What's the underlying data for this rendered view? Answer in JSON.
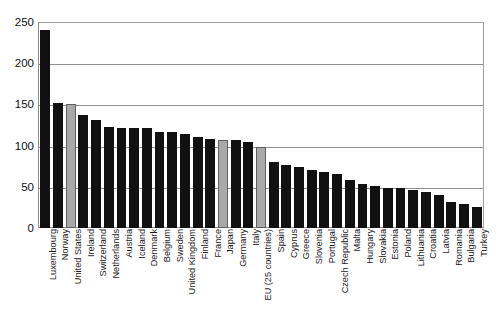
{
  "chart_data": {
    "type": "bar",
    "title": "",
    "subtitle": "",
    "xlabel": "",
    "ylabel": "",
    "ylim": [
      0,
      250
    ],
    "yticks": [
      0,
      50,
      100,
      150,
      200,
      250
    ],
    "grid": true,
    "legend": "none",
    "orientation": "vertical",
    "categories": [
      "Luxembourg",
      "Norway",
      "United States",
      "Ireland",
      "Switzerland",
      "Netherlands",
      "Austria",
      "Iceland",
      "Denmark",
      "Belgium",
      "Sweden",
      "United Kingdom",
      "Finland",
      "France",
      "Japan",
      "Germany",
      "Italy",
      "EU (25 countries)",
      "Spain",
      "Cyprus",
      "Greece",
      "Slovenia",
      "Portugal",
      "Czech Republic",
      "Malta",
      "Hungary",
      "Slovakia",
      "Estonia",
      "Poland",
      "Lithuania",
      "Croatia",
      "Latvia",
      "Romania",
      "Bulgaria",
      "Turkey"
    ],
    "values": [
      240,
      152,
      150,
      137,
      131,
      123,
      121,
      121,
      121,
      117,
      116,
      114,
      110,
      108,
      107,
      107,
      104,
      98,
      80,
      77,
      74,
      71,
      68,
      66,
      58,
      54,
      51,
      49,
      49,
      46,
      44,
      40,
      31,
      29,
      26
    ],
    "highlighted": [
      "United States",
      "Japan",
      "EU (25 countries)"
    ],
    "colors": {
      "bar": "#111111",
      "bar_highlight": "#a9a9a9",
      "bar_highlight_border": "#5f5f5f",
      "grid": "#8f8f8f",
      "axis": "#8c8c8c",
      "text": "#1a1a1a",
      "background": "#ffffff"
    }
  }
}
